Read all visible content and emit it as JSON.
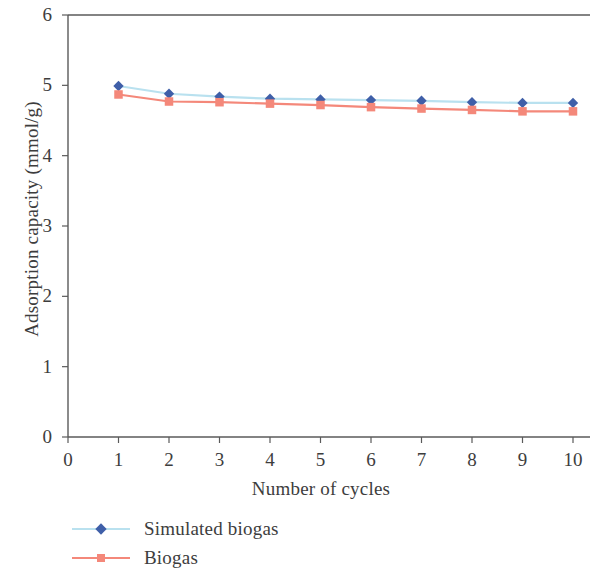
{
  "chart_data": {
    "type": "line",
    "title": "",
    "xlabel": "Number of cycles",
    "ylabel": "Adsorption capacity (mmol/g)",
    "xlim": [
      0,
      10
    ],
    "ylim": [
      0,
      6
    ],
    "xticks": [
      "0",
      "1",
      "2",
      "3",
      "4",
      "5",
      "6",
      "7",
      "8",
      "9",
      "10"
    ],
    "yticks": [
      "0",
      "1",
      "2",
      "3",
      "4",
      "5",
      "6"
    ],
    "grid": false,
    "legend_position": "below-axes-left",
    "x": [
      1,
      2,
      3,
      4,
      5,
      6,
      7,
      8,
      9,
      10
    ],
    "series": [
      {
        "name": "Simulated biogas",
        "color": "#3f5fa8",
        "line_color": "#b9e1ef",
        "marker": "diamond",
        "values": [
          4.99,
          4.88,
          4.84,
          4.81,
          4.8,
          4.79,
          4.78,
          4.76,
          4.75,
          4.75
        ]
      },
      {
        "name": "Biogas",
        "color": "#f4887a",
        "line_color": "#f4887a",
        "marker": "square",
        "values": [
          4.87,
          4.77,
          4.76,
          4.74,
          4.72,
          4.69,
          4.67,
          4.65,
          4.63,
          4.63
        ]
      }
    ]
  },
  "axes": {
    "frame_color": "#5a5a5a"
  },
  "legend": {
    "items": [
      {
        "label": "Simulated biogas"
      },
      {
        "label": "Biogas"
      }
    ]
  }
}
